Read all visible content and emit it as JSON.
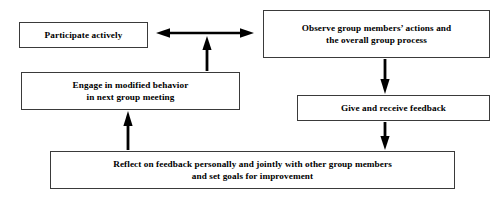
{
  "diagram": {
    "background_color": "#ffffff",
    "stroke_color": "#000000",
    "box_border_color": "#3a3a3a",
    "nodes": [
      {
        "id": "participate",
        "label": "Participate actively"
      },
      {
        "id": "observe",
        "label": "Observe group members’ actions and\nthe overall group process"
      },
      {
        "id": "engage",
        "label": "Engage in modified behavior\nin next group meeting"
      },
      {
        "id": "feedback",
        "label": "Give and receive feedback"
      },
      {
        "id": "reflect",
        "label": "Reflect on feedback personally and jointly with other group members\nand set goals for improvement"
      }
    ],
    "connectors": [
      {
        "id": "participate-observe",
        "from": "participate",
        "to": "observe",
        "style": "double-headed-horizontal-arrow",
        "direction": "bidirectional"
      },
      {
        "id": "engage-participate-link",
        "from": "engage",
        "to": "participate-observe",
        "style": "vertical-arrow",
        "direction": "up"
      },
      {
        "id": "observe-feedback",
        "from": "observe",
        "to": "feedback",
        "style": "vertical-arrow",
        "direction": "down"
      },
      {
        "id": "feedback-reflect",
        "from": "feedback",
        "to": "reflect",
        "style": "vertical-arrow",
        "direction": "down"
      },
      {
        "id": "reflect-engage",
        "from": "reflect",
        "to": "engage",
        "style": "vertical-arrow",
        "direction": "up"
      }
    ]
  }
}
